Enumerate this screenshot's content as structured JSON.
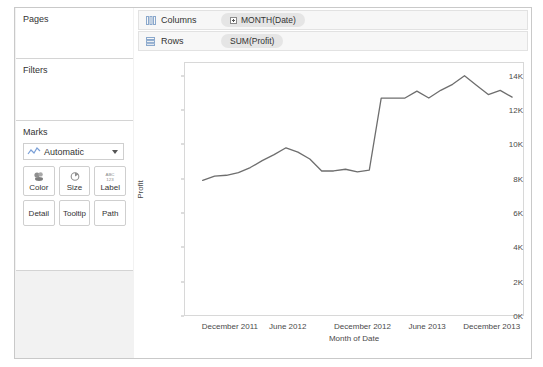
{
  "sidebar": {
    "cards": [
      {
        "title": "Pages"
      },
      {
        "title": "Filters"
      },
      {
        "title": "Marks"
      }
    ],
    "marks": {
      "type_label": "Automatic",
      "type_icon": "line-mark-icon",
      "dropdown_icon": "chevron-down-icon",
      "buttons": [
        {
          "label": "Color",
          "icon": "color-palette-icon"
        },
        {
          "label": "Size",
          "icon": "size-circle-icon"
        },
        {
          "label": "Label",
          "icon": "abc123-label-icon"
        },
        {
          "label": "Detail",
          "icon": ""
        },
        {
          "label": "Tooltip",
          "icon": ""
        },
        {
          "label": "Path",
          "icon": ""
        }
      ]
    }
  },
  "shelves": [
    {
      "name": "Columns",
      "icon": "columns-grid-icon",
      "pill": {
        "label": "MONTH(Date)",
        "has_expand": true
      }
    },
    {
      "name": "Rows",
      "icon": "rows-grid-icon",
      "pill": {
        "label": "SUM(Profit)",
        "has_expand": false
      }
    }
  ],
  "chart_data": {
    "type": "line",
    "title": "",
    "xlabel": "Month of Date",
    "ylabel": "Profit",
    "ylim": [
      0,
      14800
    ],
    "yticks": [
      0,
      2000,
      4000,
      6000,
      8000,
      10000,
      12000,
      14000
    ],
    "ytick_labels": [
      "0K",
      "2K",
      "4K",
      "6K",
      "8K",
      "10K",
      "12K",
      "14K"
    ],
    "xticks": [
      "December 2011",
      "June 2012",
      "December 2012",
      "June 2013",
      "December 2013"
    ],
    "xtick_positions": [
      0.135,
      0.305,
      0.525,
      0.715,
      0.905
    ],
    "grid": false,
    "legend": "none",
    "line_color": "#6e6e6e",
    "line_width": 1.3,
    "series": [
      {
        "name": "SUM(Profit)",
        "x": [
          "2011-10",
          "2011-11",
          "2011-12",
          "2012-01",
          "2012-02",
          "2012-03",
          "2012-04",
          "2012-05",
          "2012-06",
          "2012-07",
          "2012-08",
          "2012-09",
          "2012-10",
          "2012-11",
          "2012-12",
          "2013-01",
          "2013-02",
          "2013-03",
          "2013-04",
          "2013-05",
          "2013-06",
          "2013-07",
          "2013-08",
          "2013-09",
          "2013-10",
          "2013-11",
          "2013-12"
        ],
        "values": [
          7900,
          8150,
          8200,
          8350,
          8650,
          9050,
          9400,
          9800,
          9550,
          9150,
          8450,
          8450,
          8550,
          8400,
          8500,
          12700,
          12700,
          12700,
          13100,
          12700,
          13150,
          13500,
          14000,
          13450,
          12900,
          13150,
          12750
        ]
      }
    ]
  }
}
